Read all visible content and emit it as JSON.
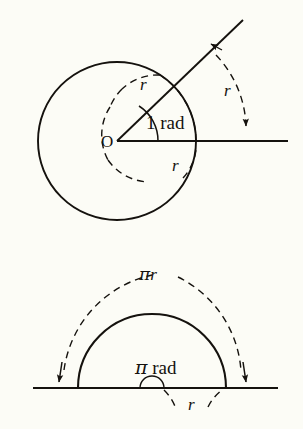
{
  "figure": {
    "background_color": "#fcfcf6",
    "ink_color": "#15120e",
    "width": 303,
    "height": 429
  },
  "panels": [
    {
      "id": "one-radian",
      "name": "one-radian-panel",
      "description": "Circle with central angle of 1 radian subtending an arc equal to the radius",
      "center_label": "O",
      "angle_label": "1 rad",
      "radius_labels": [
        "r",
        "r",
        "r"
      ],
      "geometry": {
        "center": [
          117,
          141
        ],
        "radius": 79,
        "angle_degrees": 57.3,
        "initial_side_end": [
          288,
          141
        ],
        "terminal_side_end": [
          240,
          25
        ]
      }
    },
    {
      "id": "pi-radians",
      "name": "pi-radians-panel",
      "description": "Semicircle with central angle of pi radians subtending an arc of length pi r",
      "arc_label": "πr",
      "arc_label_pi": "π",
      "arc_label_r": "r",
      "angle_label": "π rad",
      "angle_label_pi": "π",
      "angle_label_rad": "rad",
      "radius_label": "r",
      "geometry": {
        "center": [
          152,
          388
        ],
        "radius": 74,
        "baseline_y": 388,
        "baseline_x_start": 35,
        "baseline_x_end": 275,
        "dashed_arc_radius": 113
      }
    }
  ],
  "labels": {
    "origin": "O",
    "one_rad": "1 rad",
    "r": "r",
    "pi_r": "πr",
    "pi_rad": "π rad",
    "pi_symbol": "π",
    "rad_word": "rad",
    "one_digit": "1"
  }
}
